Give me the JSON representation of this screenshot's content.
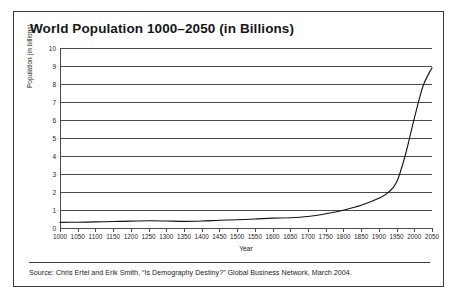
{
  "figure": {
    "title": "World Population 1000–2050 (in Billions)",
    "source": "Source: Chris Ertel and Erik Smith, “Is Demography Destiny?” Global Business Network, March 2004.",
    "border_color": "#3a3a3a",
    "background_color": "#ffffff"
  },
  "chart_data": {
    "type": "line",
    "title": "World Population 1000–2050 (in Billions)",
    "xlabel": "Year",
    "ylabel": "Population (in billions)",
    "xlim": [
      1000,
      2050
    ],
    "ylim": [
      0,
      10
    ],
    "grid": true,
    "legend": null,
    "line_color": "#111111",
    "xticks": [
      1000,
      1050,
      1100,
      1150,
      1200,
      1250,
      1300,
      1350,
      1400,
      1450,
      1500,
      1550,
      1600,
      1650,
      1700,
      1750,
      1800,
      1850,
      1900,
      1950,
      2000,
      2050
    ],
    "yticks": [
      0,
      1,
      2,
      3,
      4,
      5,
      6,
      7,
      8,
      9,
      10
    ],
    "series": [
      {
        "name": "World population",
        "x": [
          1000,
          1050,
          1100,
          1150,
          1200,
          1250,
          1300,
          1350,
          1400,
          1450,
          1500,
          1550,
          1600,
          1650,
          1700,
          1750,
          1800,
          1850,
          1900,
          1925,
          1950,
          1975,
          2000,
          2025,
          2050
        ],
        "values": [
          0.31,
          0.32,
          0.34,
          0.36,
          0.38,
          0.4,
          0.39,
          0.37,
          0.39,
          0.43,
          0.46,
          0.5,
          0.55,
          0.57,
          0.64,
          0.79,
          0.99,
          1.26,
          1.65,
          1.95,
          2.54,
          4.07,
          6.09,
          7.9,
          8.9
        ]
      }
    ]
  }
}
